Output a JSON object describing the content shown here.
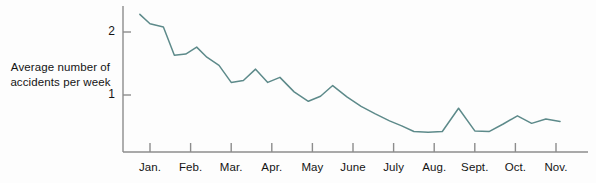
{
  "chart_data": {
    "type": "line",
    "title": "",
    "xlabel": "",
    "ylabel": "Average number of accidents per week",
    "ylabel_lines": [
      "Average number of",
      "accidents per week"
    ],
    "categories": [
      "Jan.",
      "Feb.",
      "Mar.",
      "Apr.",
      "May",
      "June",
      "July",
      "Aug.",
      "Sept.",
      "Oct.",
      "Nov."
    ],
    "ytick_labels": [
      "2",
      "1"
    ],
    "ytick_values": [
      2,
      1
    ],
    "ylim": [
      0,
      2.45
    ],
    "xlim": [
      0.75,
      11.4
    ],
    "grid": false,
    "legend": null,
    "series": [
      {
        "name": "Average number of accidents per week",
        "color": "#5d8a8a",
        "x": [
          0.75,
          1.0,
          1.33,
          1.6,
          1.88,
          2.15,
          2.4,
          2.7,
          3.0,
          3.3,
          3.6,
          3.9,
          4.2,
          4.55,
          4.9,
          5.2,
          5.5,
          5.85,
          6.2,
          6.55,
          6.9,
          7.2,
          7.5,
          7.85,
          8.2,
          8.6,
          9.0,
          9.35,
          9.7,
          10.05,
          10.4,
          10.75,
          11.1
        ],
        "values": [
          2.28,
          2.13,
          2.08,
          1.63,
          1.65,
          1.76,
          1.6,
          1.47,
          1.2,
          1.23,
          1.41,
          1.2,
          1.28,
          1.05,
          0.9,
          0.98,
          1.15,
          0.97,
          0.82,
          0.7,
          0.59,
          0.51,
          0.42,
          0.41,
          0.42,
          0.79,
          0.43,
          0.42,
          0.54,
          0.67,
          0.55,
          0.62,
          0.58
        ],
        "note": "weekly averages declining from about 2.3 in early January to about 0.2 in late November"
      }
    ],
    "axis": {
      "y_axis_x_px": 123,
      "baseline_y_px": 152,
      "tick_spacing_px": 40.6
    }
  },
  "ticks": {
    "y": [
      {
        "label": "2",
        "value": 2
      },
      {
        "label": "1",
        "value": 1
      }
    ],
    "x": [
      {
        "label": "Jan."
      },
      {
        "label": "Feb."
      },
      {
        "label": "Mar."
      },
      {
        "label": "Apr."
      },
      {
        "label": "May"
      },
      {
        "label": "June"
      },
      {
        "label": "July"
      },
      {
        "label": "Aug."
      },
      {
        "label": "Sept."
      },
      {
        "label": "Oct."
      },
      {
        "label": "Nov."
      }
    ]
  },
  "colors": {
    "line": "#5d8a8a",
    "axis": "#8c8c8c",
    "text": "#141414",
    "background": "#fdfdfd"
  }
}
